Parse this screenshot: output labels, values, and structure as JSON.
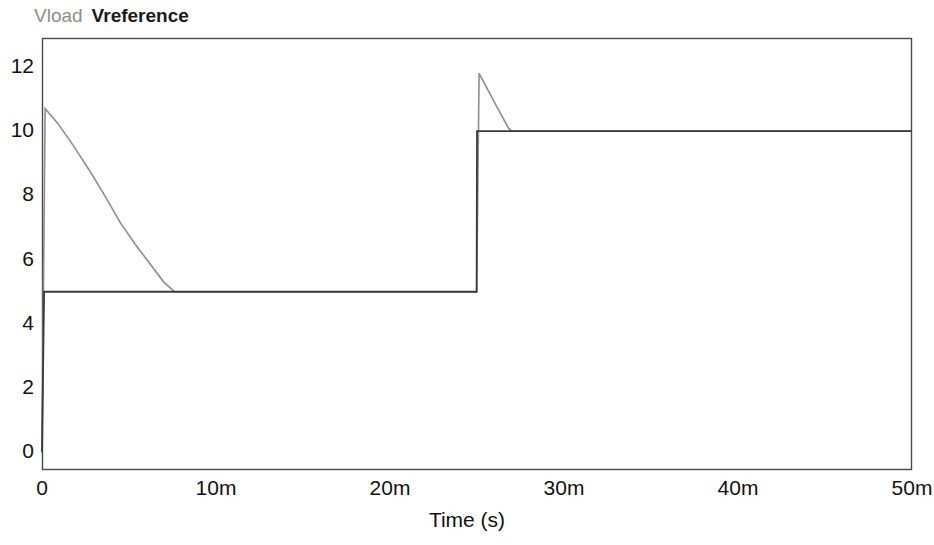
{
  "legend": {
    "entries": [
      {
        "label": "Vload",
        "color": "#8d8d8d"
      },
      {
        "label": "Vreference",
        "color": "#1a1a1a"
      }
    ]
  },
  "axes": {
    "x_title": "Time (s)",
    "y_title": "",
    "x_ticks": [
      "0",
      "10m",
      "20m",
      "30m",
      "40m",
      "50m"
    ],
    "y_ticks": [
      "0",
      "2",
      "4",
      "6",
      "8",
      "10",
      "12"
    ]
  },
  "chart_data": {
    "type": "line",
    "title": "",
    "subtitle": "",
    "xlabel": "Time (s)",
    "ylabel": "",
    "xlim": [
      0,
      0.05
    ],
    "ylim": [
      -0.55,
      12.9
    ],
    "x_tick_values": [
      0,
      0.01,
      0.02,
      0.03,
      0.04,
      0.05
    ],
    "x_tick_labels": [
      "0",
      "10m",
      "20m",
      "30m",
      "40m",
      "50m"
    ],
    "y_tick_values": [
      0,
      2,
      4,
      6,
      8,
      10,
      12
    ],
    "y_tick_labels": [
      "0",
      "2",
      "4",
      "6",
      "8",
      "10",
      "12"
    ],
    "grid": false,
    "legend_position": "above-left",
    "series": [
      {
        "name": "Vload",
        "color": "#8d8d8d",
        "width": 1.6,
        "points": [
          [
            0.0,
            0.0
          ],
          [
            0.00018,
            10.7
          ],
          [
            0.0009,
            10.25
          ],
          [
            0.0018,
            9.55
          ],
          [
            0.0027,
            8.8
          ],
          [
            0.0036,
            8.0
          ],
          [
            0.0045,
            7.15
          ],
          [
            0.0054,
            6.45
          ],
          [
            0.0063,
            5.8
          ],
          [
            0.007,
            5.3
          ],
          [
            0.00762,
            5.0
          ],
          [
            0.012,
            5.0
          ],
          [
            0.018,
            5.0
          ],
          [
            0.024,
            5.0
          ],
          [
            0.02498,
            5.0
          ],
          [
            0.02512,
            11.8
          ],
          [
            0.026,
            10.9
          ],
          [
            0.0268,
            10.1
          ],
          [
            0.027,
            10.0
          ],
          [
            0.03,
            10.0
          ],
          [
            0.04,
            10.0
          ],
          [
            0.05,
            10.0
          ]
        ]
      },
      {
        "name": "Vreference",
        "color": "#3a3a3a",
        "width": 1.8,
        "points": [
          [
            0.0,
            0.0
          ],
          [
            0.00012,
            5.0
          ],
          [
            0.01,
            5.0
          ],
          [
            0.02,
            5.0
          ],
          [
            0.02498,
            5.0
          ],
          [
            0.025,
            10.0
          ],
          [
            0.03,
            10.0
          ],
          [
            0.04,
            10.0
          ],
          [
            0.05,
            10.0
          ]
        ]
      }
    ],
    "annotations": [
      {
        "text": "Vload initial overshoot",
        "x": 0.0002,
        "y": 10.7
      },
      {
        "text": "Reference step 5V to 10V",
        "x": 0.025,
        "y": 10.0
      },
      {
        "text": "Vload step overshoot",
        "x": 0.02512,
        "y": 11.8
      }
    ]
  },
  "geometry": {
    "plot_left": 42,
    "plot_right": 912,
    "plot_top": 38,
    "plot_bottom": 470,
    "y_at_0": 435,
    "px_per_unit_y": 30.5,
    "px_per_second_x": 17400
  }
}
